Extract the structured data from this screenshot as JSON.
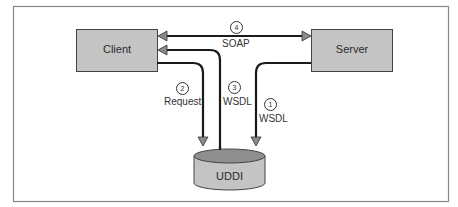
{
  "diagram": {
    "nodes": {
      "client": {
        "label": "Client"
      },
      "server": {
        "label": "Server"
      },
      "uddi": {
        "label": "UDDI"
      }
    },
    "edges": [
      {
        "step": "1",
        "label": "WSDL",
        "from": "Server",
        "to": "UDDI"
      },
      {
        "step": "2",
        "label": "Request",
        "from": "Client",
        "to": "UDDI"
      },
      {
        "step": "3",
        "label": "WSDL",
        "from": "UDDI",
        "to": "Client"
      },
      {
        "step": "4",
        "label": "SOAP",
        "from": "Client",
        "to": "Server",
        "bidirectional": true
      }
    ],
    "colors": {
      "box_fill": "#c4c4c4",
      "box_stroke": "#444444",
      "cyl_top": "#8f8f8f",
      "frame": "#888888",
      "line": "#1a1a1a"
    }
  }
}
